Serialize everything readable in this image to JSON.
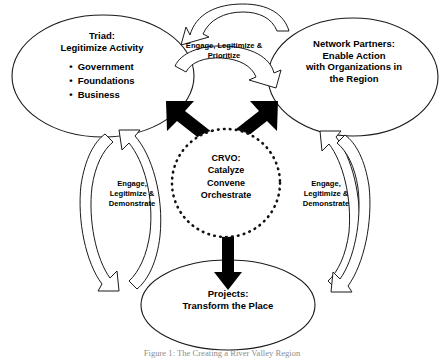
{
  "diagram": {
    "colors": {
      "stroke": "#1a1a1a",
      "arrow_fill": "#000000",
      "background": "#ffffff",
      "caption": "#8e8e8e"
    },
    "nodes": [
      {
        "id": "triad",
        "title_lines": [
          "Triad:",
          "Legitimize Activity"
        ],
        "title": "Triad: Legitimize Activity",
        "bullets": [
          "Government",
          "Foundations",
          "Business"
        ],
        "shape": "ellipse"
      },
      {
        "id": "network-partners",
        "title_lines": [
          "Network Partners:",
          "Enable Action",
          "with Organizations in",
          "the Region"
        ],
        "title": "Network Partners: Enable Action with Organizations in the Region",
        "bullets": [],
        "shape": "ellipse"
      },
      {
        "id": "crvo",
        "title_lines": [
          "CRVO:",
          "Catalyze",
          "Convene",
          "Orchestrate"
        ],
        "title": "CRVO: Catalyze Convene Orchestrate",
        "bullets": [],
        "shape": "dotted-circle"
      },
      {
        "id": "projects",
        "title_lines": [
          "Projects:",
          "Transform the Place"
        ],
        "title": "Projects: Transform the Place",
        "bullets": [],
        "shape": "ellipse"
      }
    ],
    "connector_labels": [
      {
        "id": "top",
        "lines": [
          "Engage, Legitimize &",
          "Prioritize"
        ],
        "text": "Engage, Legitimize & Prioritize"
      },
      {
        "id": "left",
        "lines": [
          "Engage,",
          "Legitimize &",
          "Demonstrate"
        ],
        "text": "Engage, Legitimize & Demonstrate"
      },
      {
        "id": "right",
        "lines": [
          "Engage,",
          "Legitimize &",
          "Demonstrate"
        ],
        "text": "Engage, Legitimize & Demonstrate"
      }
    ],
    "caption": "Figure 1: The Creating a River Valley Region"
  }
}
